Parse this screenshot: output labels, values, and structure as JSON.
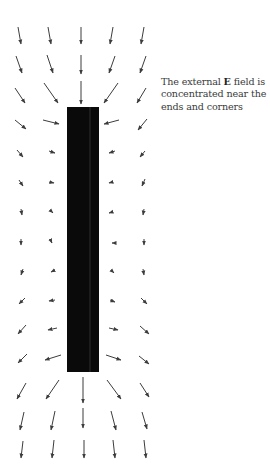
{
  "caption": {
    "before": "The external ",
    "bold": "E",
    "after": " field is concentrated near the ends and corners"
  },
  "conductor": {
    "x": 67,
    "y": 107,
    "width": 32,
    "height": 265,
    "color": "#0a0a0a",
    "highlight_x": 90,
    "highlight_color": "#2e2e2e"
  },
  "arrow_color": "#3c3c3c",
  "arrows": [
    [
      18,
      27,
      21,
      44
    ],
    [
      48,
      27,
      51,
      44
    ],
    [
      81,
      27,
      81,
      44
    ],
    [
      113,
      27,
      110,
      44
    ],
    [
      144,
      27,
      141,
      44
    ],
    [
      16,
      56,
      22,
      73
    ],
    [
      47,
      55,
      53,
      73
    ],
    [
      81,
      55,
      81,
      74
    ],
    [
      115,
      56,
      109,
      73
    ],
    [
      146,
      56,
      140,
      73
    ],
    [
      15,
      88,
      25,
      103
    ],
    [
      44,
      83,
      58,
      103
    ],
    [
      81,
      81,
      81,
      104
    ],
    [
      118,
      83,
      104,
      103
    ],
    [
      146,
      88,
      137,
      103
    ],
    [
      15,
      120,
      26,
      129
    ],
    [
      43,
      120,
      59,
      124
    ],
    [
      119,
      120,
      104,
      124
    ],
    [
      147,
      119,
      138,
      130
    ],
    [
      17,
      150,
      23,
      157
    ],
    [
      49,
      151,
      55,
      153
    ],
    [
      115,
      151,
      109,
      153
    ],
    [
      145,
      151,
      140,
      157
    ],
    [
      19,
      180,
      23,
      186
    ],
    [
      49,
      182,
      54,
      183
    ],
    [
      113,
      182,
      109,
      183
    ],
    [
      145,
      179,
      142,
      186
    ],
    [
      21,
      209,
      22,
      215
    ],
    [
      51,
      211,
      53,
      213
    ],
    [
      112,
      212,
      109,
      213
    ],
    [
      144,
      209,
      143,
      215
    ],
    [
      21,
      239,
      21,
      245
    ],
    [
      51,
      241,
      52,
      243
    ],
    [
      113,
      243,
      112,
      243
    ],
    [
      144,
      239,
      144,
      245
    ],
    [
      23,
      269,
      21,
      275
    ],
    [
      53,
      271,
      51,
      272
    ],
    [
      112,
      271,
      114,
      273
    ],
    [
      143,
      269,
      144,
      275
    ],
    [
      25,
      298,
      19,
      304
    ],
    [
      55,
      300,
      49,
      301
    ],
    [
      110,
      300,
      115,
      302
    ],
    [
      141,
      298,
      147,
      304
    ],
    [
      26,
      325,
      18,
      334
    ],
    [
      57,
      328,
      48,
      330
    ],
    [
      109,
      328,
      118,
      330
    ],
    [
      140,
      326,
      149,
      334
    ],
    [
      27,
      354,
      18,
      363
    ],
    [
      61,
      355,
      45,
      360
    ],
    [
      106,
      355,
      121,
      360
    ],
    [
      139,
      356,
      149,
      364
    ],
    [
      26,
      383,
      17,
      399
    ],
    [
      59,
      380,
      46,
      399
    ],
    [
      83,
      377,
      83,
      403
    ],
    [
      107,
      380,
      121,
      399
    ],
    [
      140,
      383,
      149,
      397
    ],
    [
      24,
      412,
      20,
      430
    ],
    [
      55,
      411,
      51,
      430
    ],
    [
      83,
      408,
      83,
      428
    ],
    [
      111,
      411,
      116,
      430
    ],
    [
      142,
      412,
      147,
      429
    ],
    [
      23,
      441,
      21,
      458
    ],
    [
      54,
      440,
      52,
      458
    ],
    [
      84,
      440,
      84,
      458
    ],
    [
      113,
      440,
      115,
      458
    ],
    [
      144,
      440,
      146,
      458
    ]
  ]
}
